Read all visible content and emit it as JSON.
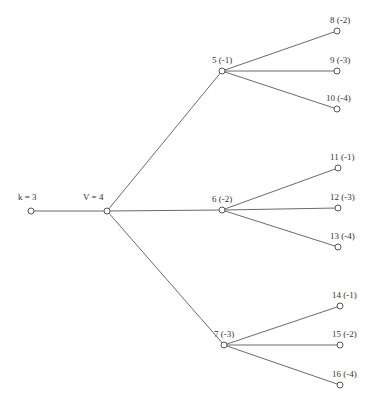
{
  "diagram": {
    "type": "tree",
    "nodes": [
      {
        "id": "k",
        "label": "k = 3",
        "x": 31,
        "y": 211,
        "lx": 18,
        "ly": 200
      },
      {
        "id": "v",
        "label": "V = 4",
        "x": 107,
        "y": 211,
        "lx": 83,
        "ly": 200
      },
      {
        "id": "n5",
        "label": "5 (-1)",
        "x": 222,
        "y": 71,
        "lx": 212,
        "ly": 63
      },
      {
        "id": "n6",
        "label": "6 (-2)",
        "x": 222,
        "y": 210,
        "lx": 212,
        "ly": 202
      },
      {
        "id": "n7",
        "label": "7 (-3)",
        "x": 224,
        "y": 345,
        "lx": 214,
        "ly": 337
      },
      {
        "id": "n8",
        "label": "8 (-2)",
        "x": 337,
        "y": 31,
        "lx": 330,
        "ly": 23
      },
      {
        "id": "n9",
        "label": "9 (-3)",
        "x": 337,
        "y": 71,
        "lx": 330,
        "ly": 63
      },
      {
        "id": "n10",
        "label": "10 (-4)",
        "x": 337,
        "y": 109,
        "lx": 326,
        "ly": 101
      },
      {
        "id": "n11",
        "label": "11 (-1)",
        "x": 338,
        "y": 168,
        "lx": 330,
        "ly": 160
      },
      {
        "id": "n12",
        "label": "12 (-3)",
        "x": 338,
        "y": 208,
        "lx": 330,
        "ly": 200
      },
      {
        "id": "n13",
        "label": "13 (-4)",
        "x": 338,
        "y": 247,
        "lx": 330,
        "ly": 239
      },
      {
        "id": "n14",
        "label": "14 (-1)",
        "x": 340,
        "y": 306,
        "lx": 332,
        "ly": 298
      },
      {
        "id": "n15",
        "label": "15 (-2)",
        "x": 340,
        "y": 345,
        "lx": 332,
        "ly": 337
      },
      {
        "id": "n16",
        "label": "16 (-4)",
        "x": 340,
        "y": 385,
        "lx": 332,
        "ly": 377
      }
    ],
    "edges": [
      [
        "k",
        "v"
      ],
      [
        "v",
        "n5"
      ],
      [
        "v",
        "n6"
      ],
      [
        "v",
        "n7"
      ],
      [
        "n5",
        "n8"
      ],
      [
        "n5",
        "n9"
      ],
      [
        "n5",
        "n10"
      ],
      [
        "n6",
        "n11"
      ],
      [
        "n6",
        "n12"
      ],
      [
        "n6",
        "n13"
      ],
      [
        "n7",
        "n14"
      ],
      [
        "n7",
        "n15"
      ],
      [
        "n7",
        "n16"
      ]
    ]
  }
}
